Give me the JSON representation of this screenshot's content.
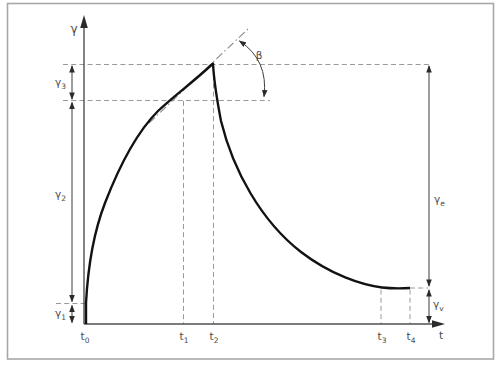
{
  "figure": {
    "type": "creep-recovery strain vs time diagram",
    "colors": {
      "background": "#ffffff",
      "frame": "#a8a8a8",
      "curve": "#121212",
      "axis": "#4f4f4f",
      "guide": "#9a9a9a",
      "tangent": "#888888",
      "label": "#4a4a4a"
    },
    "labels": {
      "y_axis": "γ",
      "x_axis": "t",
      "beta": "β",
      "gamma_1": {
        "base": "γ",
        "sub": "1"
      },
      "gamma_2": {
        "base": "γ",
        "sub": "2"
      },
      "gamma_3": {
        "base": "γ",
        "sub": "3"
      },
      "gamma_e": {
        "base": "γ",
        "sub": "e"
      },
      "gamma_v": {
        "base": "γ",
        "sub": "v"
      },
      "t_0": {
        "base": "t",
        "sub": "0"
      },
      "t_1": {
        "base": "t",
        "sub": "1"
      },
      "t_2": {
        "base": "t",
        "sub": "2"
      },
      "t_3": {
        "base": "t",
        "sub": "3"
      },
      "t_4": {
        "base": "t",
        "sub": "4"
      }
    }
  }
}
